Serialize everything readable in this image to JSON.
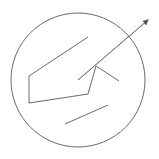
{
  "diagram": {
    "width": 159,
    "height": 159,
    "stroke_color": "#6a6a6a",
    "circle": {
      "cx": 78,
      "cy": 80,
      "r": 67
    },
    "polyline": [
      [
        88,
        37
      ],
      [
        29,
        76
      ],
      [
        29,
        103
      ],
      [
        88,
        94
      ],
      [
        96,
        66
      ],
      [
        119,
        81
      ]
    ],
    "arrow": {
      "x1": 78,
      "y1": 80,
      "x2": 148,
      "y2": 20
    },
    "segment": {
      "x1": 65,
      "y1": 124,
      "x2": 108,
      "y2": 105
    }
  }
}
